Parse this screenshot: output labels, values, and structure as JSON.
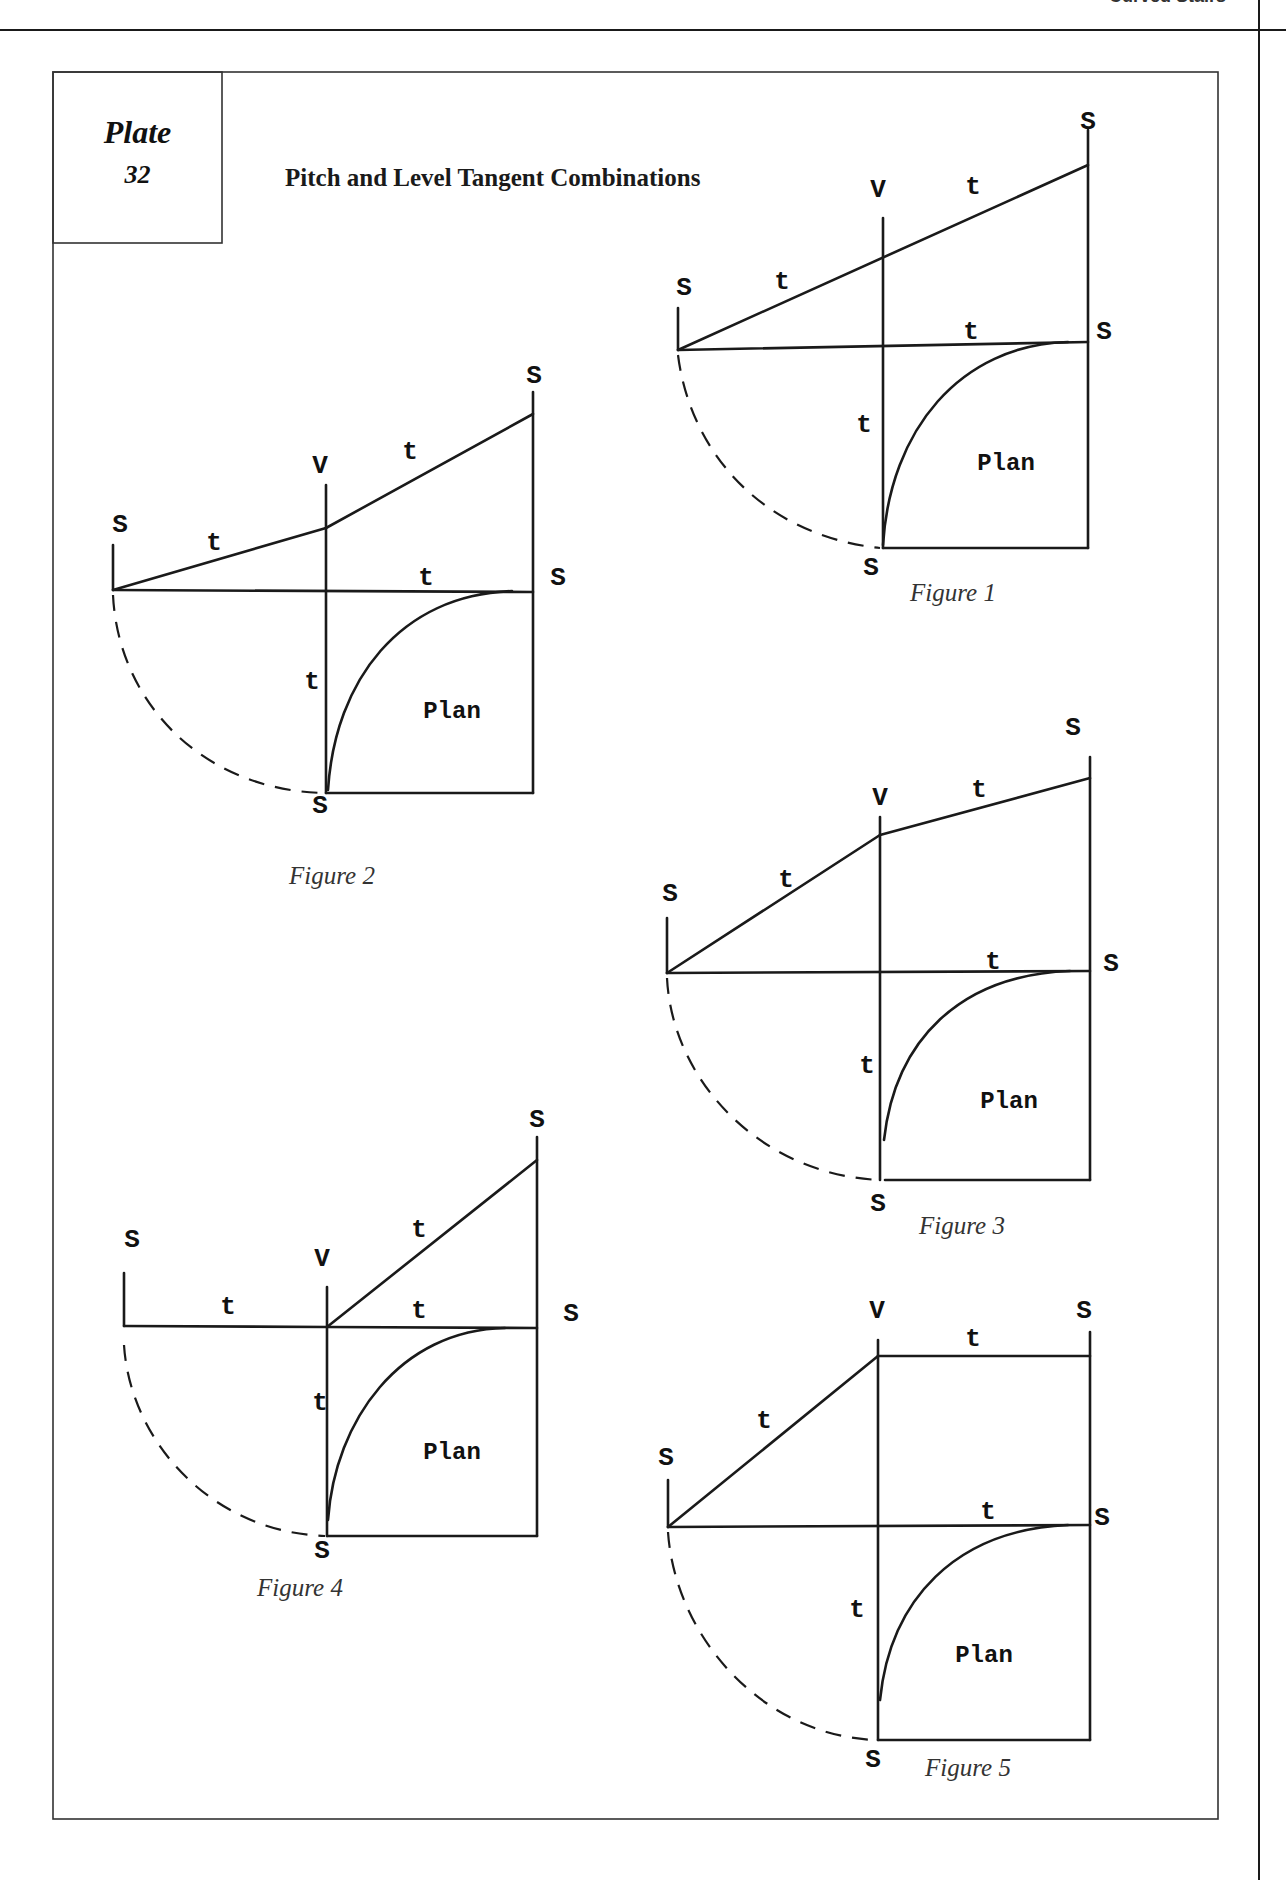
{
  "page": {
    "running_head": "Curved Stairs"
  },
  "plate": {
    "word": "Plate",
    "number": "32",
    "title": "Pitch and Level Tangent Combinations"
  },
  "labels": {
    "spring": "S",
    "vertex": "V",
    "tangent": "t",
    "plan": "Plan"
  },
  "figures": [
    {
      "caption": "Figure 1"
    },
    {
      "caption": "Figure 2"
    },
    {
      "caption": "Figure 3"
    },
    {
      "caption": "Figure 4"
    },
    {
      "caption": "Figure 5"
    }
  ]
}
